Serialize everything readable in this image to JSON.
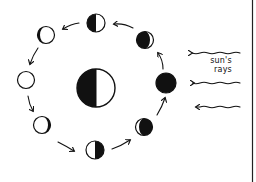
{
  "diagram": {
    "label_line1": "sun's",
    "label_line2": "rays",
    "colors": {
      "ink": "#111111",
      "paper": "#ffffff"
    },
    "earth": {
      "cx": 96,
      "cy": 88,
      "r": 19,
      "dark_side": "left"
    },
    "moons": [
      {
        "name": "new-moon",
        "cx": 166,
        "cy": 83,
        "phase": "new"
      },
      {
        "name": "waxing-crescent",
        "cx": 145,
        "cy": 40,
        "phase": "waxing-crescent"
      },
      {
        "name": "first-quarter",
        "cx": 96,
        "cy": 23,
        "phase": "first-quarter"
      },
      {
        "name": "waxing-gibbous",
        "cx": 46,
        "cy": 35,
        "phase": "waxing-gibbous"
      },
      {
        "name": "full-moon",
        "cx": 26,
        "cy": 80,
        "phase": "full"
      },
      {
        "name": "waning-gibbous",
        "cx": 42,
        "cy": 125,
        "phase": "waning-gibbous"
      },
      {
        "name": "last-quarter",
        "cx": 95,
        "cy": 150,
        "phase": "last-quarter"
      },
      {
        "name": "waning-crescent",
        "cx": 144,
        "cy": 127,
        "phase": "waning-crescent"
      }
    ],
    "sun_rays": [
      {
        "y": 53,
        "x_start": 240,
        "x_end": 191
      },
      {
        "y": 83,
        "x_start": 240,
        "x_end": 193
      },
      {
        "y": 107,
        "x_start": 240,
        "x_end": 195
      }
    ]
  }
}
